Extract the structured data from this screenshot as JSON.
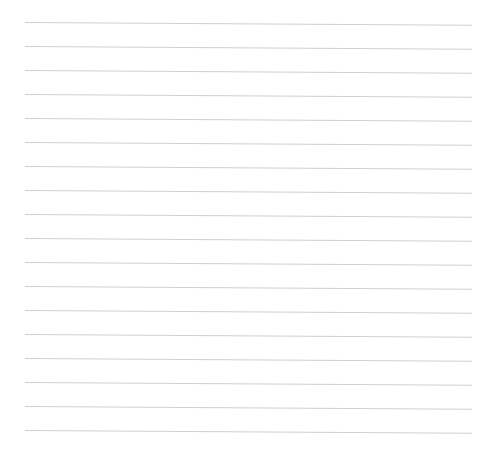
{
  "page": {
    "type": "lined-paper",
    "background": "#ffffff",
    "line_color": "#cfcfcf",
    "line_count": 18,
    "first_line_y": 22,
    "line_spacing": 24,
    "line_left": 25,
    "line_right": 472
  }
}
